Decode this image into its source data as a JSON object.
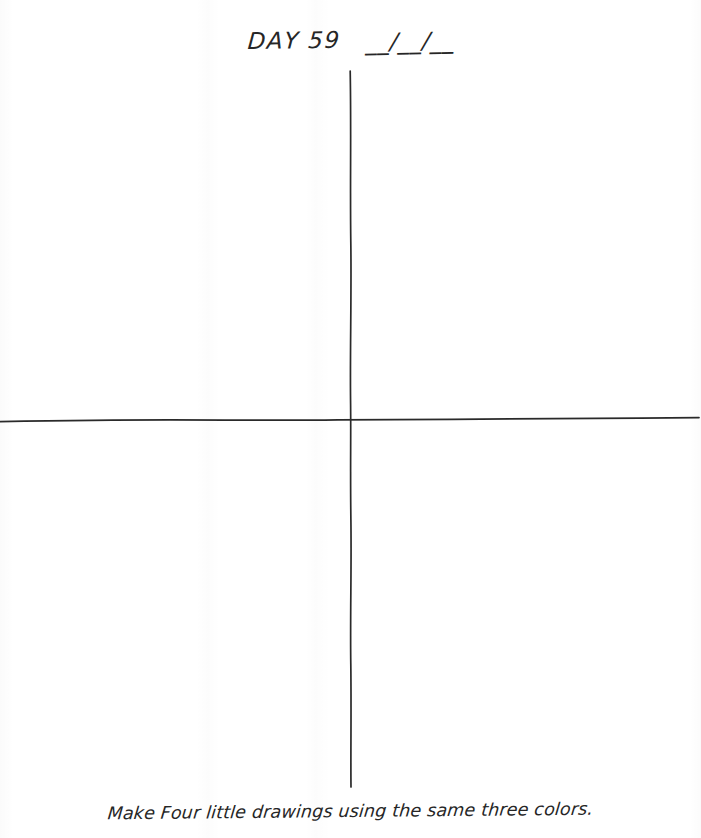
{
  "page": {
    "background_color": "#ffffff",
    "ink_color": "#2a2a2a",
    "width": 701,
    "height": 838
  },
  "header": {
    "day_label": "DAY 59",
    "date_blank": "__/__/__"
  },
  "canvas": {
    "description": "hand-drawn cross dividing the page into four empty quadrants",
    "vertical_line": {
      "x": 351,
      "y_start": 71,
      "y_end": 787
    },
    "horizontal_line": {
      "y": 420,
      "x_start": 0,
      "x_end": 699
    },
    "quadrants": [
      {
        "name": "top-left",
        "content": ""
      },
      {
        "name": "top-right",
        "content": ""
      },
      {
        "name": "bottom-left",
        "content": ""
      },
      {
        "name": "bottom-right",
        "content": ""
      }
    ]
  },
  "caption": {
    "text": "Make Four little drawings using the same three colors."
  }
}
